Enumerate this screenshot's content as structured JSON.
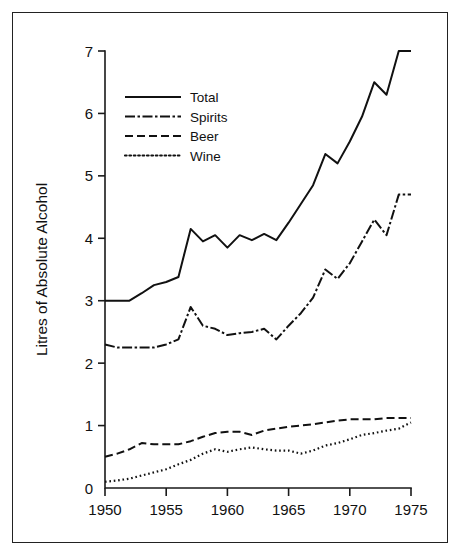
{
  "figure": {
    "background_color": "#ffffff",
    "ink_color": "#111111",
    "border_color": "#222222"
  },
  "chart_data": {
    "type": "line",
    "title": "",
    "xlabel": "",
    "ylabel": "Litres of Absolute Alcohol",
    "xlim": [
      1950,
      1975
    ],
    "ylim": [
      0,
      7
    ],
    "grid": false,
    "legend_position": "upper-left-inside",
    "xticks": [
      1950,
      1955,
      1960,
      1965,
      1970,
      1975
    ],
    "xtick_labels": [
      "1950",
      "1955",
      "1960",
      "1965",
      "1970",
      "1975"
    ],
    "yticks": [
      0,
      1,
      2,
      3,
      4,
      5,
      6,
      7
    ],
    "ytick_labels": [
      "0",
      "1",
      "2",
      "3",
      "4",
      "5",
      "6",
      "7"
    ],
    "x": [
      1950,
      1951,
      1952,
      1953,
      1954,
      1955,
      1956,
      1957,
      1958,
      1959,
      1960,
      1961,
      1962,
      1963,
      1964,
      1965,
      1966,
      1967,
      1968,
      1969,
      1970,
      1971,
      1972,
      1973,
      1974,
      1975
    ],
    "series": [
      {
        "name": "Total",
        "style": "solid",
        "values": [
          3.0,
          3.0,
          3.0,
          3.12,
          3.25,
          3.3,
          3.38,
          4.15,
          3.95,
          4.05,
          3.85,
          4.05,
          3.97,
          4.07,
          3.97,
          4.25,
          4.55,
          4.85,
          5.35,
          5.2,
          5.55,
          5.95,
          6.5,
          6.3,
          7.0,
          7.0
        ]
      },
      {
        "name": "Spirits",
        "style": "dash-dot",
        "values": [
          2.3,
          2.25,
          2.25,
          2.25,
          2.25,
          2.3,
          2.38,
          2.9,
          2.6,
          2.55,
          2.45,
          2.48,
          2.5,
          2.55,
          2.38,
          2.6,
          2.8,
          3.05,
          3.5,
          3.35,
          3.6,
          3.95,
          4.3,
          4.05,
          4.7,
          4.7
        ]
      },
      {
        "name": "Beer",
        "style": "dashed",
        "values": [
          0.5,
          0.55,
          0.62,
          0.72,
          0.7,
          0.7,
          0.7,
          0.75,
          0.82,
          0.88,
          0.9,
          0.9,
          0.85,
          0.92,
          0.95,
          0.98,
          1.0,
          1.02,
          1.05,
          1.08,
          1.1,
          1.1,
          1.1,
          1.12,
          1.12,
          1.12
        ]
      },
      {
        "name": "Wine",
        "style": "dotted",
        "values": [
          0.1,
          0.12,
          0.15,
          0.2,
          0.25,
          0.3,
          0.38,
          0.45,
          0.55,
          0.62,
          0.58,
          0.62,
          0.65,
          0.62,
          0.6,
          0.6,
          0.55,
          0.6,
          0.68,
          0.72,
          0.78,
          0.85,
          0.88,
          0.92,
          0.95,
          1.05
        ]
      }
    ]
  },
  "legend": {
    "entries": [
      {
        "label": "Total",
        "style": "solid"
      },
      {
        "label": "Spirits",
        "style": "dash-dot"
      },
      {
        "label": "Beer",
        "style": "dashed"
      },
      {
        "label": "Wine",
        "style": "dotted"
      }
    ]
  }
}
